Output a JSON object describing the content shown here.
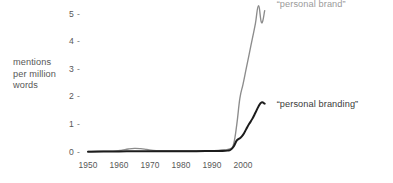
{
  "chart_data": {
    "type": "line",
    "title": "",
    "subtitle": "",
    "xlabel": "",
    "ylabel": "mentions per million words",
    "ylabel_lines": [
      "mentions",
      "per million",
      "words"
    ],
    "xlim": [
      1950,
      2008
    ],
    "ylim": [
      0,
      5.4
    ],
    "grid": false,
    "legend_position": "inline-right-of-line-ends",
    "y_ticks": [
      0,
      1,
      2,
      3,
      4,
      5
    ],
    "y_tick_labels": [
      "0",
      "1",
      "2",
      "3",
      "4",
      "5"
    ],
    "y_tick_mark": "-",
    "x_ticks": [
      1950,
      1960,
      1970,
      1980,
      1990,
      2000
    ],
    "x_tick_labels": [
      "1950",
      "1960",
      "1970",
      "1980",
      "1990",
      "2000"
    ],
    "series": [
      {
        "name": "“personal brand”",
        "color": "#8c8c8c",
        "x": [
          1950,
          1953,
          1956,
          1959,
          1961,
          1963,
          1965,
          1967,
          1969,
          1971,
          1974,
          1977,
          1980,
          1983,
          1986,
          1989,
          1992,
          1994,
          1996,
          1997,
          1998,
          1999,
          2000,
          2001,
          2002,
          2003,
          2004,
          2005,
          2006,
          2007
        ],
        "values": [
          0.02,
          0.03,
          0.03,
          0.04,
          0.07,
          0.11,
          0.13,
          0.12,
          0.09,
          0.06,
          0.05,
          0.05,
          0.05,
          0.05,
          0.05,
          0.05,
          0.06,
          0.08,
          0.12,
          0.3,
          1.0,
          1.95,
          2.45,
          3.0,
          3.55,
          4.1,
          4.65,
          5.3,
          4.68,
          5.12
        ]
      },
      {
        "name": "“personal branding”",
        "color": "#1c1c1c",
        "x": [
          1950,
          1955,
          1960,
          1965,
          1970,
          1975,
          1980,
          1985,
          1990,
          1993,
          1995,
          1996,
          1997,
          1998,
          1999,
          2000,
          2001,
          2002,
          2003,
          2004,
          2005,
          2006,
          2007
        ],
        "values": [
          0.01,
          0.02,
          0.02,
          0.03,
          0.03,
          0.03,
          0.03,
          0.03,
          0.04,
          0.04,
          0.05,
          0.08,
          0.2,
          0.42,
          0.5,
          0.62,
          0.82,
          1.02,
          1.2,
          1.42,
          1.65,
          1.8,
          1.75
        ]
      }
    ],
    "annotations": [
      {
        "text": "“personal brand”",
        "series": "“personal brand”",
        "color": "#9a9a9a"
      },
      {
        "text": "“personal branding”",
        "series": "“personal branding”",
        "color": "#3a3a3a"
      }
    ]
  },
  "colors": {
    "background": "#ffffff",
    "text": "#575757",
    "series_brand": "#8c8c8c",
    "series_branding": "#1c1c1c"
  }
}
